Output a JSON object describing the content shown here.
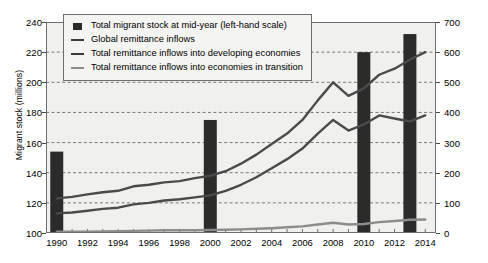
{
  "chart_data": {
    "type": "bar",
    "title": "",
    "subtitle": "",
    "xlabel": "",
    "ylabel": "Migrant stock (millions)",
    "ylabel_right": "Remittance inflows (billions of United States dollars)",
    "grid": true,
    "legend_position": "top-left",
    "x": [
      1990,
      1991,
      1992,
      1993,
      1994,
      1995,
      1996,
      1997,
      1998,
      1999,
      2000,
      2001,
      2002,
      2003,
      2004,
      2005,
      2006,
      2007,
      2008,
      2009,
      2010,
      2011,
      2012,
      2013,
      2014
    ],
    "xtick_labels": [
      "1990",
      "1992",
      "1994",
      "1996",
      "1998",
      "2000",
      "2002",
      "2004",
      "2006",
      "2008",
      "2010",
      "2012",
      "2014"
    ],
    "xtick_values": [
      1990,
      1992,
      1994,
      1996,
      1998,
      2000,
      2002,
      2004,
      2006,
      2008,
      2010,
      2012,
      2014
    ],
    "xlim": [
      1989.3,
      2014.7
    ],
    "ylim_left": [
      100,
      240
    ],
    "ytick_left": [
      100,
      120,
      140,
      160,
      180,
      200,
      220,
      240
    ],
    "ylim_right": [
      0,
      700
    ],
    "ytick_right": [
      0,
      100,
      200,
      300,
      400,
      500,
      600,
      700
    ],
    "bars": {
      "name": "Total migrant stock at mid-year (left-hand scale)",
      "axis": "left",
      "color": "#2b2b2b",
      "categories": [
        1990,
        2000,
        2010,
        2013
      ],
      "values": [
        154,
        175,
        220,
        232
      ]
    },
    "series": [
      {
        "name": "Global remittance inflows",
        "axis": "right",
        "color": "#4a4a4a",
        "values": [
          115,
          120,
          128,
          135,
          140,
          155,
          160,
          168,
          172,
          182,
          190,
          205,
          230,
          260,
          295,
          330,
          375,
          440,
          500,
          455,
          480,
          525,
          545,
          575,
          600
        ]
      },
      {
        "name": "Total remittance inflows into developing economies",
        "axis": "right",
        "color": "#4a4a4a",
        "values": [
          65,
          68,
          74,
          80,
          84,
          95,
          100,
          108,
          112,
          118,
          125,
          140,
          160,
          185,
          215,
          245,
          280,
          330,
          375,
          340,
          360,
          390,
          380,
          370,
          390
        ]
      },
      {
        "name": "Total remittance inflows into economies in transition",
        "axis": "right",
        "color": "#8c8c8c",
        "values": [
          4,
          4,
          4,
          5,
          6,
          7,
          8,
          9,
          9,
          9,
          10,
          11,
          12,
          14,
          16,
          19,
          22,
          28,
          34,
          28,
          30,
          36,
          40,
          44,
          45
        ]
      }
    ]
  }
}
